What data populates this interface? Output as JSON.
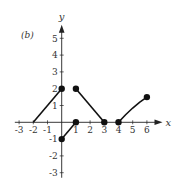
{
  "chart_data": {
    "type": "line",
    "title": "",
    "panel_label": "(b)",
    "xlabel": "x",
    "ylabel": "y",
    "xlim": [
      -3.3,
      7.1
    ],
    "ylim": [
      -3.3,
      5.8
    ],
    "grid": false,
    "x_ticks": [
      -3,
      -2,
      -1,
      1,
      2,
      3,
      4,
      5,
      6
    ],
    "x_tick_labels": [
      "-3",
      "-2",
      "-1",
      "1",
      "2",
      "3",
      "4",
      "5",
      "6"
    ],
    "y_ticks": [
      5,
      4,
      3,
      2,
      1,
      -1,
      -2,
      -3
    ],
    "y_tick_labels": [
      "5",
      "4",
      "3",
      "2",
      "1",
      "-1",
      "-2",
      "-3"
    ],
    "series": [
      {
        "name": "segment-1",
        "kind": "line",
        "points": [
          [
            -2,
            0
          ],
          [
            0,
            2
          ]
        ]
      },
      {
        "name": "segment-2",
        "kind": "line",
        "points": [
          [
            0,
            -1
          ],
          [
            1,
            0
          ]
        ]
      },
      {
        "name": "segment-3",
        "kind": "line",
        "points": [
          [
            1,
            2
          ],
          [
            3,
            0
          ]
        ]
      },
      {
        "name": "segment-4",
        "kind": "curve",
        "points": [
          [
            4,
            0
          ],
          [
            4.5,
            0.45
          ],
          [
            5,
            0.85
          ],
          [
            5.5,
            1.2
          ],
          [
            6,
            1.5
          ]
        ]
      }
    ],
    "filled_points": [
      [
        0,
        2
      ],
      [
        0,
        -1
      ],
      [
        1,
        0
      ],
      [
        1,
        2
      ],
      [
        3,
        0
      ],
      [
        4,
        0
      ],
      [
        6,
        1.5
      ]
    ],
    "colors": {
      "line": "#111111",
      "axis": "#222222",
      "text": "#333333"
    }
  },
  "layout": {
    "origin_px": [
      61.7,
      122.3
    ],
    "x_unit_px": 14.2,
    "y_unit_px": 16.8
  }
}
